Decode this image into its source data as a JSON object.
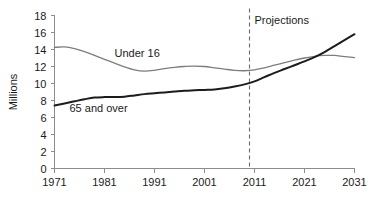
{
  "chart_data": {
    "type": "line",
    "title": "",
    "xlabel": "",
    "ylabel": "Millions",
    "xlim": [
      1971,
      2031
    ],
    "ylim": [
      0,
      18
    ],
    "grid": false,
    "legend_position": "inline-labels",
    "x_ticks": [
      "1971",
      "1981",
      "1991",
      "2001",
      "2011",
      "2021",
      "2031"
    ],
    "x_tick_values": [
      1971,
      1981,
      1991,
      2001,
      2011,
      2021,
      2031
    ],
    "y_ticks": [
      "0",
      "2",
      "4",
      "6",
      "8",
      "10",
      "12",
      "14",
      "16",
      "18"
    ],
    "y_tick_values": [
      0,
      2,
      4,
      6,
      8,
      10,
      12,
      14,
      16,
      18
    ],
    "annotations": [
      {
        "name": "projections-divider",
        "label": "Projections",
        "x": 2010,
        "style": "dashed-vertical-line"
      }
    ],
    "series": [
      {
        "name": "Under 16",
        "color": "#7d7d7d",
        "label": "Under 16",
        "label_x": 1983,
        "label_y": 13.15,
        "x": [
          1971,
          1973,
          1975,
          1977,
          1979,
          1981,
          1983,
          1985,
          1987,
          1989,
          1991,
          1993,
          1995,
          1997,
          1999,
          2001,
          2003,
          2005,
          2007,
          2009,
          2011,
          2013,
          2015,
          2017,
          2019,
          2021,
          2023,
          2025,
          2027,
          2029,
          2031
        ],
        "values": [
          14.25,
          14.3,
          14.1,
          13.75,
          13.3,
          12.85,
          12.4,
          11.95,
          11.6,
          11.45,
          11.55,
          11.75,
          11.9,
          12.0,
          12.05,
          12.0,
          11.85,
          11.7,
          11.55,
          11.5,
          11.6,
          11.85,
          12.15,
          12.45,
          12.75,
          13.0,
          13.2,
          13.3,
          13.3,
          13.15,
          13.05
        ]
      },
      {
        "name": "65 and over",
        "color": "#1c1c1c",
        "label": "65 and over",
        "label_x": 1974,
        "label_y": 6.65,
        "x": [
          1971,
          1973,
          1975,
          1977,
          1979,
          1981,
          1983,
          1985,
          1987,
          1989,
          1991,
          1993,
          1995,
          1997,
          1999,
          2001,
          2003,
          2005,
          2007,
          2009,
          2011,
          2013,
          2015,
          2017,
          2019,
          2021,
          2023,
          2025,
          2027,
          2029,
          2031
        ],
        "values": [
          7.4,
          7.65,
          7.9,
          8.15,
          8.35,
          8.4,
          8.4,
          8.45,
          8.6,
          8.75,
          8.85,
          8.95,
          9.05,
          9.15,
          9.2,
          9.25,
          9.3,
          9.45,
          9.65,
          9.9,
          10.25,
          10.75,
          11.25,
          11.7,
          12.15,
          12.6,
          13.1,
          13.7,
          14.4,
          15.1,
          15.8
        ]
      }
    ]
  }
}
